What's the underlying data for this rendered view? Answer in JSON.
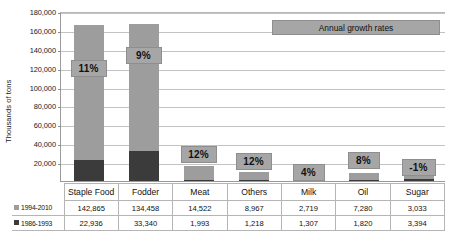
{
  "chart_data": {
    "type": "bar",
    "subtype": "stacked-column",
    "title": "",
    "xlabel": "",
    "ylabel": "Thousands of tons",
    "ylim": [
      0,
      180000
    ],
    "ytick_step": 20000,
    "ytick_labels": [
      "180,000",
      "160,000",
      "140,000",
      "120,000",
      "100,000",
      "80,000",
      "60,000",
      "40,000",
      "20,000"
    ],
    "ytick_values": [
      180000,
      160000,
      140000,
      120000,
      100000,
      80000,
      60000,
      40000,
      20000
    ],
    "grid": true,
    "legend_position": "table-left",
    "categories": [
      "Staple Food",
      "Fodder",
      "Meat",
      "Others",
      "Milk",
      "Oil",
      "Sugar"
    ],
    "series": [
      {
        "name": "1994-2010",
        "color": "#9d9d9d",
        "values": [
          142865,
          134458,
          14522,
          8967,
          2719,
          7280,
          3033
        ],
        "labels": [
          "142,865",
          "134,458",
          "14,522",
          "8,967",
          "2,719",
          "7,280",
          "3,033"
        ]
      },
      {
        "name": "1986-1993",
        "color": "#3b3b3b",
        "values": [
          22936,
          33340,
          1993,
          1218,
          1307,
          1820,
          3394
        ],
        "labels": [
          "22,936",
          "33,340",
          "1,993",
          "1,218",
          "1,307",
          "1,820",
          "3,394"
        ]
      }
    ],
    "annotations": {
      "banner": "Annual growth rates",
      "growth_rates": [
        "11%",
        "9%",
        "12%",
        "12%",
        "4%",
        "8%",
        "-1%"
      ]
    }
  },
  "axis": {
    "y_title": "Thousands of tons"
  },
  "banner": {
    "label": "Annual growth rates"
  },
  "growth": {
    "staple_food": "11%",
    "fodder": "9%",
    "meat": "12%",
    "others": "12%",
    "milk": "4%",
    "oil": "8%",
    "sugar": "-1%"
  },
  "table": {
    "header": [
      "",
      "Staple Food",
      "Fodder",
      "Meat",
      "Others",
      "Milk",
      "Oil",
      "Sugar"
    ],
    "rows": [
      {
        "legend": "1994-2010",
        "swatch": "light-gray-swatch",
        "cells": [
          "142,865",
          "134,458",
          "14,522",
          "8,967",
          "2,719",
          "7,280",
          "3,033"
        ]
      },
      {
        "legend": "1986-1993",
        "swatch": "dark-gray-swatch",
        "cells": [
          "22,936",
          "33,340",
          "1,993",
          "1,218",
          "1,307",
          "1,820",
          "3,394"
        ]
      }
    ]
  },
  "colors": {
    "series_light": "#9d9d9d",
    "series_dark": "#3b3b3b",
    "callout_fill": "#a6a6a6",
    "gridline": "#c3c3c3"
  }
}
